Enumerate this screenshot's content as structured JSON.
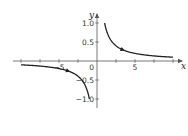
{
  "chart_data": {
    "type": "line",
    "title": "",
    "function": "y = 1/x",
    "xlabel": "x",
    "ylabel": "y",
    "xlim": [
      -10,
      10
    ],
    "ylim": [
      -1.15,
      1.15
    ],
    "grid": false,
    "legend": null,
    "x_ticks": [
      -10,
      -7.5,
      -5,
      -2.5,
      2.5,
      5,
      7.5,
      10
    ],
    "x_tick_labels": [
      {
        "value": -5,
        "label": "−5"
      },
      {
        "value": 0,
        "label": "0"
      },
      {
        "value": 5,
        "label": "5"
      }
    ],
    "y_ticks": [
      1.0,
      0.5,
      -0.5,
      -1.0
    ],
    "y_tick_labels": [
      {
        "value": 1.0,
        "label": "1.0"
      },
      {
        "value": 0.5,
        "label": "0.5"
      },
      {
        "value": -0.5,
        "label": "−0.5"
      },
      {
        "value": -1.0,
        "label": "−1.0"
      }
    ],
    "series": [
      {
        "name": "right-branch",
        "x": [
          1,
          1.25,
          1.5,
          2,
          2.5,
          3,
          4,
          5,
          6,
          7,
          8,
          9,
          10
        ],
        "y": [
          1,
          0.8,
          0.667,
          0.5,
          0.4,
          0.333,
          0.25,
          0.2,
          0.167,
          0.143,
          0.125,
          0.111,
          0.1
        ],
        "arrow_at_x": 3.5
      },
      {
        "name": "left-branch",
        "x": [
          -10,
          -9,
          -8,
          -7,
          -6,
          -5,
          -4,
          -3,
          -2.5,
          -2,
          -1.5,
          -1.25,
          -1
        ],
        "y": [
          -0.1,
          -0.111,
          -0.125,
          -0.143,
          -0.167,
          -0.2,
          -0.25,
          -0.333,
          -0.4,
          -0.5,
          -0.667,
          -0.8,
          -1
        ],
        "arrow_at_x": -3.7
      }
    ],
    "color": "#222222"
  }
}
